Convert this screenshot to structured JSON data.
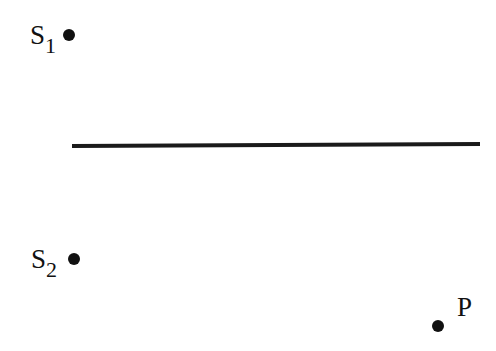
{
  "diagram": {
    "type": "double-source geometry",
    "colors": {
      "ink": "#1a1a1a",
      "background": "#ffffff"
    },
    "line": {
      "x1": 72,
      "y1": 146,
      "x2": 480,
      "y2": 144,
      "stroke_width": 4
    },
    "points": [
      {
        "id": "S1",
        "main": "S",
        "sub": "1",
        "cx": 69,
        "cy": 35,
        "r": 6
      },
      {
        "id": "S2",
        "main": "S",
        "sub": "2",
        "cx": 74,
        "cy": 259,
        "r": 6
      },
      {
        "id": "P",
        "main": "P",
        "sub": "",
        "cx": 438,
        "cy": 326,
        "r": 6
      }
    ]
  }
}
